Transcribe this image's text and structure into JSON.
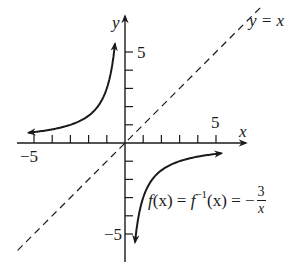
{
  "chart_data": {
    "type": "line",
    "title": "",
    "xlabel": "x",
    "ylabel": "y",
    "xlim": [
      -5.9,
      6.4
    ],
    "ylim": [
      -6.4,
      6.7
    ],
    "grid": false,
    "x_ticks": [
      -5,
      -4,
      -3,
      -2,
      -1,
      1,
      2,
      3,
      4,
      5
    ],
    "y_ticks": [
      -5,
      -4,
      -3,
      -2,
      -1,
      1,
      2,
      3,
      4,
      5
    ],
    "x_tick_labels": {
      "-5": "−5",
      "5": "5"
    },
    "y_tick_labels": {
      "-5": "−5",
      "5": "5"
    },
    "series": [
      {
        "name": "f(x) = f^{-1}(x) = -3/x",
        "style": "solid",
        "branches": [
          {
            "x": [
              -5.3,
              -4,
              -3,
              -2,
              -1.5,
              -1,
              -0.75,
              -0.55
            ],
            "y": [
              0.57,
              0.75,
              1,
              1.5,
              2,
              3,
              4,
              5.45
            ]
          },
          {
            "x": [
              0.55,
              0.75,
              1,
              1.5,
              2,
              3,
              4,
              5.3
            ],
            "y": [
              -5.45,
              -4,
              -3,
              -2,
              -1.5,
              -1,
              -0.75,
              -0.57
            ]
          }
        ]
      },
      {
        "name": "y = x",
        "style": "dashed",
        "x": [
          -5.9,
          7.5
        ],
        "y": [
          -5.9,
          7.5
        ]
      }
    ],
    "annotations": [
      {
        "text": "y = x",
        "near": [
          7.6,
          6.6
        ]
      },
      {
        "text": "f(x) = f^{-1}(x) = -3/x",
        "near": [
          3.0,
          -2.0
        ]
      }
    ]
  },
  "labels": {
    "x_axis": "x",
    "y_axis": "y",
    "x_pos5": "5",
    "x_neg5": "−5",
    "y_pos5": "5",
    "y_neg5": "−5",
    "line_label": "y = x",
    "func_fx": "f",
    "func_paren_x1": "(x) = ",
    "func_finv": "f",
    "func_inv_sup": "−1",
    "func_paren_x2": "(x) = −",
    "func_num": "3",
    "func_den": "x"
  },
  "colors": {
    "ink": "#1a1a1a",
    "axis": "#333333",
    "background": "#ffffff"
  }
}
